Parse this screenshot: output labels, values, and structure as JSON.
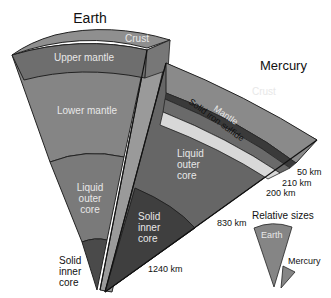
{
  "earth": {
    "title": "Earth",
    "layers": {
      "crust": "Crust",
      "upper_mantle": "Upper mantle",
      "lower_mantle": "Lower mantle",
      "outer_core": [
        "Liquid",
        "outer",
        "core"
      ],
      "inner_core": [
        "Solid",
        "inner",
        "core"
      ]
    }
  },
  "mercury": {
    "title": "Mercury",
    "layers": {
      "crust": "Crust",
      "mantle": "Mantle",
      "sulfide": "Solid iron sulfide",
      "outer_core": [
        "Liquid",
        "outer",
        "core"
      ],
      "inner_core": [
        "Solid",
        "inner",
        "core"
      ]
    },
    "depths": {
      "d1": "50 km",
      "d2": "210 km",
      "d3": "200 km",
      "d4": "830 km",
      "d5": "1240 km"
    }
  },
  "relative_sizes": {
    "title": "Relative sizes",
    "earth": "Earth",
    "mercury": "Mercury"
  },
  "colors": {
    "crust": "#8f8f8f",
    "upper_mantle": "#6e6e6e",
    "lower_mantle": "#858585",
    "outer_core": "#7a7a7a",
    "inner_core": "#4a4a4a",
    "merc_crust": "#8a8a8a",
    "merc_mantle": "#6a6a6a",
    "merc_sulfide": "#d8d8d8",
    "merc_outer": "#666666",
    "merc_inner": "#3f3f3f"
  }
}
